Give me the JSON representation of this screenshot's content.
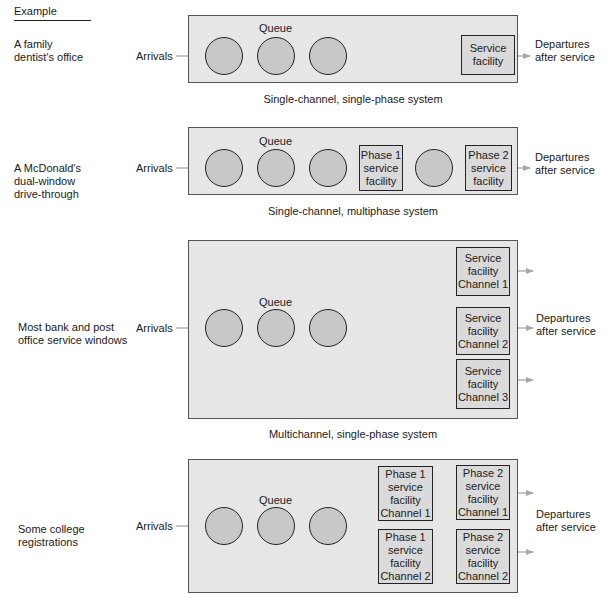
{
  "example_header": "Example",
  "colors": {
    "panel_bg": "#e6e6e6",
    "circle_fill": "#c8c8c8",
    "facility_fill": "#dadada",
    "arrow": "#a8a8a8",
    "outline": "#222222"
  },
  "systems": [
    {
      "example": [
        "A family",
        "dentist's office"
      ],
      "arrivals": "Arrivals",
      "queue": "Queue",
      "facilities": [
        [
          "Service",
          "facility"
        ]
      ],
      "departures": [
        "Departures",
        "after service"
      ],
      "caption": "Single-channel, single-phase system"
    },
    {
      "example": [
        "A McDonald's",
        "dual-window",
        "drive-through"
      ],
      "arrivals": "Arrivals",
      "queue": "Queue",
      "facilities": [
        [
          "Phase 1",
          "service",
          "facility"
        ],
        [
          "Phase 2",
          "service",
          "facility"
        ]
      ],
      "departures": [
        "Departures",
        "after service"
      ],
      "caption": "Single-channel, multiphase system"
    },
    {
      "example": [
        "Most bank and post",
        "office service windows"
      ],
      "arrivals": "Arrivals",
      "queue": "Queue",
      "facilities": [
        [
          "Service",
          "facility",
          "Channel 1"
        ],
        [
          "Service",
          "facility",
          "Channel 2"
        ],
        [
          "Service",
          "facility",
          "Channel 3"
        ]
      ],
      "departures": [
        "Departures",
        "after service"
      ],
      "caption": "Multichannel, single-phase system"
    },
    {
      "example": [
        "Some college",
        "registrations"
      ],
      "arrivals": "Arrivals",
      "queue": "Queue",
      "facilities": [
        [
          "Phase 1",
          "service",
          "facility",
          "Channel 1"
        ],
        [
          "Phase 1",
          "service",
          "facility",
          "Channel 2"
        ],
        [
          "Phase 2",
          "service",
          "facility",
          "Channel 1"
        ],
        [
          "Phase 2",
          "service",
          "facility",
          "Channel 2"
        ]
      ],
      "departures": [
        "Departures",
        "after service"
      ],
      "caption": ""
    }
  ]
}
